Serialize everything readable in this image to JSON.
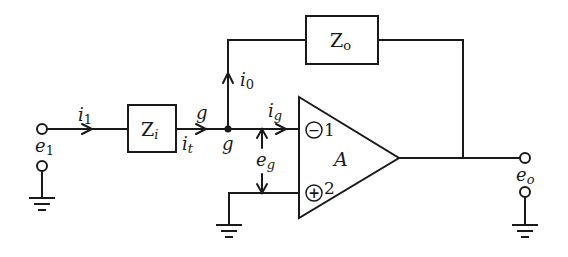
{
  "diagram": {
    "type": "inverting-op-amp-circuit",
    "colors": {
      "ink": "#1a1a1a",
      "background": "#ffffff"
    },
    "components": {
      "input_impedance": {
        "label": "Z",
        "subscript": "i"
      },
      "feedback_impedance": {
        "label": "Z",
        "subscript": "o"
      },
      "amplifier": {
        "gain_label": "A",
        "inverting_input": {
          "symbol": "−",
          "pin": "1"
        },
        "noninverting_input": {
          "symbol": "+",
          "pin": "2"
        }
      }
    },
    "labels": {
      "input_voltage": {
        "main": "e",
        "sub": "1"
      },
      "output_voltage": {
        "main": "e",
        "sub": "o"
      },
      "input_current": {
        "main": "i",
        "sub": "1"
      },
      "impedance_current": {
        "main": "i",
        "sub": "t"
      },
      "feedback_current": {
        "main": "i",
        "sub": "0"
      },
      "grid_current": {
        "main": "i",
        "sub": "g"
      },
      "grid_voltage": {
        "main": "e",
        "sub": "g"
      },
      "node_g_top": "g",
      "node_g_bottom": "g"
    }
  }
}
